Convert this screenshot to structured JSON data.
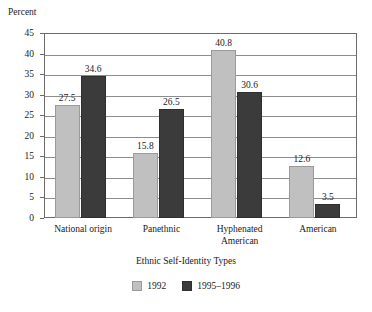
{
  "chart_data": {
    "type": "bar",
    "title": "",
    "xlabel": "Ethnic Self-Identity Types",
    "ylabel": "Percent",
    "ylim": [
      0,
      45
    ],
    "ytick_step": 5,
    "yticks": [
      45,
      40,
      35,
      30,
      25,
      20,
      15,
      10,
      5,
      0
    ],
    "ytick_labels": [
      "45",
      "40",
      "35",
      "30",
      "25",
      "20",
      "15",
      "10",
      "5",
      "0"
    ],
    "grid": true,
    "legend_position": "bottom",
    "categories": [
      "National origin",
      "Panethnic",
      "Hyphenated\nAmerican",
      "American"
    ],
    "series": [
      {
        "name": "1992",
        "color": "#c0c0c0",
        "values": [
          27.5,
          15.8,
          40.8,
          12.6
        ],
        "labels": [
          "27.5",
          "15.8",
          "40.8",
          "12.6"
        ]
      },
      {
        "name": "1995–1996",
        "color": "#3b3b3b",
        "values": [
          34.6,
          26.5,
          30.6,
          3.5
        ],
        "labels": [
          "34.6",
          "26.5",
          "30.6",
          "3.5"
        ]
      }
    ]
  },
  "legend": {
    "items": [
      {
        "label": "1992",
        "swatch": "legend-swatch-1992"
      },
      {
        "label": "1995–1996",
        "swatch": "legend-swatch-1995-1996"
      }
    ]
  }
}
